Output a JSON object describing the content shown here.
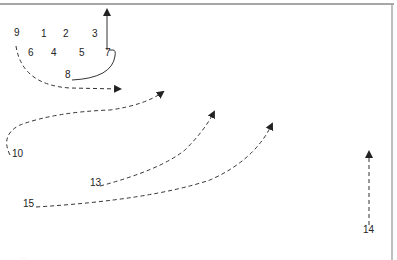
{
  "diagram": {
    "type": "play-diagram",
    "colors": {
      "line": "#333333",
      "border": "#888888",
      "background": "#ffffff"
    },
    "positions": [
      {
        "id": "9",
        "x": 14,
        "y": 36
      },
      {
        "id": "1",
        "x": 41,
        "y": 37
      },
      {
        "id": "2",
        "x": 63,
        "y": 37
      },
      {
        "id": "3",
        "x": 92,
        "y": 37
      },
      {
        "id": "6",
        "x": 28,
        "y": 56
      },
      {
        "id": "4",
        "x": 51,
        "y": 56
      },
      {
        "id": "5",
        "x": 79,
        "y": 56
      },
      {
        "id": "7",
        "x": 105,
        "y": 56
      },
      {
        "id": "8",
        "x": 65,
        "y": 78
      },
      {
        "id": "10",
        "x": 12,
        "y": 157
      },
      {
        "id": "13",
        "x": 90,
        "y": 186
      },
      {
        "id": "15",
        "x": 23,
        "y": 207
      },
      {
        "id": "14",
        "x": 363,
        "y": 233
      }
    ],
    "routes": [
      {
        "from": "7",
        "style": "solid",
        "desc": "hook then vertical up"
      },
      {
        "from": "9",
        "style": "dashed",
        "desc": "curve down and right"
      },
      {
        "from": "10",
        "style": "dashed",
        "desc": "S-curve up-right"
      },
      {
        "from": "13",
        "style": "dashed",
        "desc": "curve up-right"
      },
      {
        "from": "15",
        "style": "dashed",
        "desc": "long curve up-right"
      },
      {
        "from": "14",
        "style": "dashed",
        "desc": "straight up"
      }
    ],
    "footer_text": "…"
  }
}
